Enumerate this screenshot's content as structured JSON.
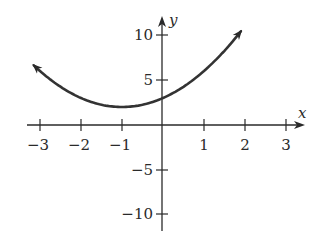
{
  "chart_data": {
    "type": "line",
    "title": "",
    "xlabel": "x",
    "ylabel": "y",
    "xlim": [
      -3,
      3
    ],
    "ylim": [
      -10,
      10
    ],
    "grid": false,
    "function": "f(x) = (x + 1)^2 + 2",
    "vertex": {
      "x": -1,
      "y": 2
    },
    "y_intercept": 3,
    "x_ticks": [
      -3,
      -2,
      -1,
      1,
      2,
      3
    ],
    "x_tick_labels": [
      "−3",
      "−2",
      "−1",
      "1",
      "2",
      "3"
    ],
    "y_ticks": [
      10,
      5,
      -5,
      -10
    ],
    "y_tick_labels": [
      "10",
      "5",
      "−5",
      "−10"
    ],
    "series": [
      {
        "name": "parabola",
        "x": [
          -3.1,
          -3,
          -2.5,
          -2,
          -1.5,
          -1,
          -0.5,
          0,
          0.5,
          1,
          1.5,
          2
        ],
        "y": [
          6.41,
          6,
          4.25,
          3,
          2.25,
          2,
          2.25,
          3,
          4.25,
          6,
          8.25,
          11
        ],
        "arrows": "both"
      }
    ],
    "color": "#333333"
  },
  "labels": {
    "x_axis": "x",
    "y_axis": "y",
    "xt0": "−3",
    "xt1": "−2",
    "xt2": "−1",
    "xt3": "1",
    "xt4": "2",
    "xt5": "3",
    "yt0": "10",
    "yt1": "5",
    "yt2": "−5",
    "yt3": "−10"
  }
}
